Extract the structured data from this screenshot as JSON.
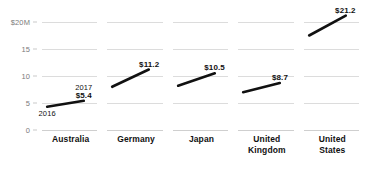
{
  "chart_data": {
    "type": "line",
    "title": "",
    "xlabel": "",
    "ylabel": "",
    "ylim": [
      0,
      23
    ],
    "grid": true,
    "legend": "none",
    "panel_layout": "small-multiples",
    "x": [
      "2016",
      "2017"
    ],
    "y_ticks": [
      {
        "value": 20,
        "label": "$20M"
      },
      {
        "value": 15,
        "label": "15"
      },
      {
        "value": 10,
        "label": "10"
      },
      {
        "value": 5,
        "label": "5"
      },
      {
        "value": 0,
        "label": "0"
      }
    ],
    "panels": [
      {
        "name": "Australia",
        "label_lines": [
          "Australia"
        ],
        "values": [
          4.3,
          5.4
        ],
        "end_value_label": "$5.4",
        "start_year_label": "2016",
        "end_year_label": "2017"
      },
      {
        "name": "Germany",
        "label_lines": [
          "Germany"
        ],
        "values": [
          8.0,
          11.2
        ],
        "end_value_label": "$11.2",
        "start_year_label": "",
        "end_year_label": ""
      },
      {
        "name": "Japan",
        "label_lines": [
          "Japan"
        ],
        "values": [
          8.2,
          10.5
        ],
        "end_value_label": "$10.5",
        "start_year_label": "",
        "end_year_label": ""
      },
      {
        "name": "United Kingdom",
        "label_lines": [
          "United",
          "Kingdom"
        ],
        "values": [
          7.0,
          8.7
        ],
        "end_value_label": "$8.7",
        "start_year_label": "",
        "end_year_label": ""
      },
      {
        "name": "United States",
        "label_lines": [
          "United",
          "States"
        ],
        "values": [
          17.5,
          21.2
        ],
        "end_value_label": "$21.2",
        "start_year_label": "",
        "end_year_label": ""
      }
    ],
    "colors": {
      "line": "#111111",
      "gridline": "#dcdcdc",
      "tick_text": "#7a7a7a",
      "label_text": "#111111",
      "background": "#ffffff"
    }
  },
  "footnote": {
    "text": ""
  }
}
